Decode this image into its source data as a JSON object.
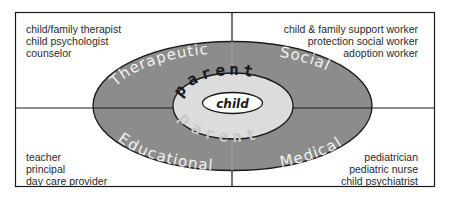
{
  "diagram": {
    "quadrants": {
      "top_left": {
        "domain": "Therapeutic",
        "roles": [
          "child/family therapist",
          "child psychologist",
          "counselor"
        ]
      },
      "top_right": {
        "domain": "Social",
        "roles": [
          "child & family support worker",
          "protection social worker",
          "adoption worker"
        ]
      },
      "bottom_left": {
        "domain": "Educational",
        "roles": [
          "teacher",
          "principal",
          "day care provider"
        ]
      },
      "bottom_right": {
        "domain": "Medical",
        "roles": [
          "pediatrician",
          "pediatric nurse",
          "child psychiatrist"
        ]
      }
    },
    "rings": {
      "middle_label": "parent",
      "middle_label_mirror": "parent",
      "center_label": "child"
    },
    "colors": {
      "outer_ring": "#8c8c8c",
      "middle_ring": "#dcdcdc",
      "center": "#ffffff",
      "lines": "#1a1a1a",
      "domain_text": "#f2f2f2"
    }
  }
}
